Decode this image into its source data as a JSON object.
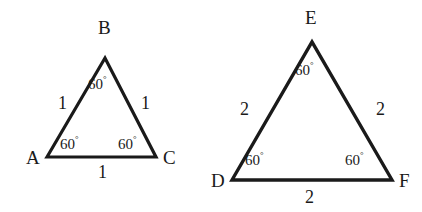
{
  "figure": {
    "background_color": "#ffffff",
    "stroke_color": "#1a1a1a",
    "text_color": "#1a1a1a",
    "degree_symbol": "°",
    "triangles": [
      {
        "name": "triangle-abc",
        "vertices": [
          {
            "name": "A",
            "label": "A"
          },
          {
            "name": "B",
            "label": "B"
          },
          {
            "name": "C",
            "label": "C"
          }
        ],
        "sides": [
          {
            "name": "AB",
            "label": "1"
          },
          {
            "name": "BC",
            "label": "1"
          },
          {
            "name": "AC",
            "label": "1"
          }
        ],
        "angles": [
          {
            "name": "angle-A",
            "value": "60",
            "label": "60"
          },
          {
            "name": "angle-B",
            "value": "60",
            "label": "60"
          },
          {
            "name": "angle-C",
            "value": "60",
            "label": "60"
          }
        ]
      },
      {
        "name": "triangle-def",
        "vertices": [
          {
            "name": "D",
            "label": "D"
          },
          {
            "name": "E",
            "label": "E"
          },
          {
            "name": "F",
            "label": "F"
          }
        ],
        "sides": [
          {
            "name": "DE",
            "label": "2"
          },
          {
            "name": "EF",
            "label": "2"
          },
          {
            "name": "DF",
            "label": "2"
          }
        ],
        "angles": [
          {
            "name": "angle-D",
            "value": "60",
            "label": "60"
          },
          {
            "name": "angle-E",
            "value": "60",
            "label": "60"
          },
          {
            "name": "angle-F",
            "value": "60",
            "label": "60"
          }
        ]
      }
    ]
  }
}
